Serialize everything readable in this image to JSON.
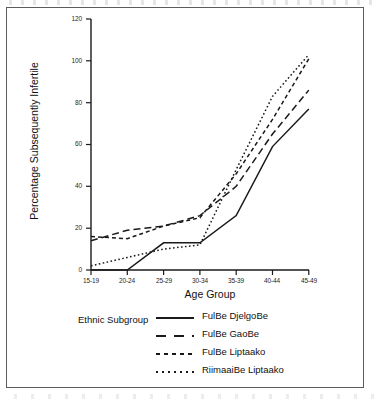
{
  "chart_data": {
    "type": "line",
    "title": "",
    "xlabel": "Age Group",
    "ylabel": "Percentage Subsequently Infertile",
    "categories": [
      "15-19",
      "20-24",
      "25-29",
      "30-34",
      "35-39",
      "40-44",
      "45-49"
    ],
    "ylim": [
      0,
      120
    ],
    "yticks": [
      0,
      20,
      40,
      60,
      80,
      100,
      120
    ],
    "grid": false,
    "legend_position": "below-axes",
    "legend_title": "Ethnic Subgroup",
    "series": [
      {
        "name": "FulBe DjelgoBe",
        "style": "solid",
        "values": [
          0,
          0,
          13,
          13,
          26,
          59,
          77
        ]
      },
      {
        "name": "FulBe GaoBe",
        "style": "long-dash",
        "values": [
          14,
          19,
          21,
          26,
          40,
          65,
          86
        ]
      },
      {
        "name": "FulBe Liptaako",
        "style": "dashed",
        "values": [
          16,
          15,
          21,
          25,
          46,
          72,
          101
        ]
      },
      {
        "name": "RiimaaiBe Liptaako",
        "style": "dotted",
        "values": [
          2,
          6,
          10,
          12,
          48,
          83,
          103
        ]
      }
    ]
  },
  "axes": {
    "y_tick_labels": [
      "120",
      "100",
      "80",
      "60",
      "40",
      "20",
      "0"
    ],
    "x_tick_labels": [
      "15-19",
      "20-24",
      "25-29",
      "30-34",
      "35-39",
      "40-44",
      "45-49"
    ]
  },
  "legend": {
    "title": "Ethnic Subgroup",
    "entries": [
      {
        "label": "FulBe DjelgoBe",
        "style": "solid"
      },
      {
        "label": "FulBe GaoBe",
        "style": "long-dash"
      },
      {
        "label": "FulBe Liptaako",
        "style": "dashed"
      },
      {
        "label": "RiimaaiBe Liptaako",
        "style": "dotted"
      }
    ]
  },
  "colors": {
    "ink": "#1a1a1a",
    "frame": "#5c5c5c",
    "background": "#ffffff"
  }
}
